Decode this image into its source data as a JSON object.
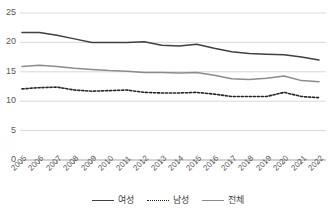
{
  "chart_data": {
    "type": "line",
    "title": "",
    "xlabel": "",
    "ylabel": "",
    "xlim": [
      2005,
      2022
    ],
    "ylim": [
      0,
      25
    ],
    "yticks": [
      0,
      5,
      10,
      15,
      20,
      25
    ],
    "grid": true,
    "legend_position": "bottom",
    "categories": [
      "2005",
      "2006",
      "2007",
      "2008",
      "2009",
      "2010",
      "2011",
      "2012",
      "2013",
      "2014",
      "2015",
      "2016",
      "2017",
      "2018",
      "2019",
      "2020",
      "2021",
      "2022"
    ],
    "series": [
      {
        "name": "여성",
        "style": "solid",
        "color": "#404040",
        "values": [
          21.7,
          21.7,
          21.2,
          20.6,
          20.0,
          20.0,
          20.0,
          20.1,
          19.5,
          19.4,
          19.7,
          19.0,
          18.4,
          18.1,
          18.0,
          17.9,
          17.5,
          17.0
        ]
      },
      {
        "name": "남성",
        "style": "dotted",
        "color": "#262626",
        "values": [
          12.1,
          12.3,
          12.4,
          11.9,
          11.7,
          11.8,
          11.9,
          11.5,
          11.4,
          11.4,
          11.5,
          11.2,
          10.8,
          10.8,
          10.8,
          11.5,
          10.8,
          10.6
        ]
      },
      {
        "name": "전체",
        "style": "solid",
        "color": "#8c8c8c",
        "values": [
          15.9,
          16.1,
          15.9,
          15.6,
          15.4,
          15.2,
          15.1,
          14.9,
          14.9,
          14.8,
          14.9,
          14.4,
          13.8,
          13.7,
          13.9,
          14.3,
          13.5,
          13.3
        ]
      }
    ]
  },
  "legend": {
    "items": [
      {
        "label": "여성",
        "swatch": "solid-dark"
      },
      {
        "label": "남성",
        "swatch": "dotted-dark"
      },
      {
        "label": "전체",
        "swatch": "solid-gray"
      }
    ]
  }
}
